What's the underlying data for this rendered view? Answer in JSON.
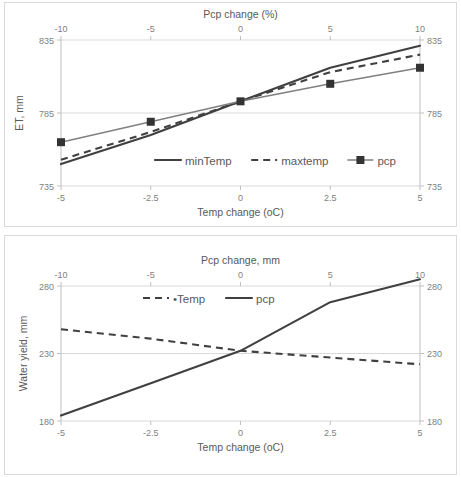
{
  "figure": {
    "charts": [
      {
        "id": "et-chart",
        "title": "",
        "type": "line",
        "x": [
          -5,
          -2.5,
          0,
          2.5,
          5
        ],
        "x2": [
          -10,
          -5,
          0,
          5,
          10
        ],
        "xlabel": "Temp change (oC)",
        "x2label": "Pcp change (%)",
        "ylabel": "ET, mm",
        "ylim": [
          735,
          835
        ],
        "yticks": [
          735,
          785,
          835
        ],
        "xticklabels": [
          "-5",
          "-2.5",
          "0",
          "2.5",
          "5"
        ],
        "x2ticklabels": [
          "-10",
          "-5",
          "0",
          "5",
          "10"
        ],
        "yticklabels": [
          "735",
          "785",
          "835"
        ],
        "y2ticklabels": [
          "735",
          "785",
          "835"
        ],
        "grid": true,
        "legend_position": "inside-bottom-center",
        "series": [
          {
            "name": "minTemp",
            "style": "solid",
            "marker": "none",
            "color": "#404040",
            "values": [
              750,
              770,
              793,
              816,
              831
            ]
          },
          {
            "name": "maxtemp",
            "style": "dashed",
            "marker": "none",
            "color": "#404040",
            "values": [
              753,
              772,
              793,
              813,
              825
            ]
          },
          {
            "name": "pcp",
            "style": "solid-thin",
            "marker": "square",
            "color": "#808080",
            "values": [
              765,
              779,
              793,
              805,
              816
            ]
          }
        ]
      },
      {
        "id": "water-yield-chart",
        "title": "",
        "type": "line",
        "x": [
          -5,
          -2.5,
          0,
          2.5,
          5
        ],
        "x2": [
          -10,
          -5,
          0,
          5,
          10
        ],
        "xlabel": "Temp change (oC)",
        "x2label": "Pcp change, mm",
        "ylabel": "Water yield, mm",
        "ylim": [
          180,
          280
        ],
        "yticks": [
          180,
          230,
          280
        ],
        "xticklabels": [
          "-5",
          "-2.5",
          "0",
          "2.5",
          "5"
        ],
        "x2ticklabels": [
          "-10",
          "-5",
          "0",
          "5",
          "10"
        ],
        "yticklabels": [
          "180",
          "230",
          "280"
        ],
        "y2ticklabels": [
          "180",
          "230",
          "280"
        ],
        "grid": true,
        "legend_position": "inside-top-center",
        "series": [
          {
            "name": "•Temp",
            "style": "dashed",
            "marker": "none",
            "color": "#404040",
            "values": [
              248,
              241,
              232,
              227,
              222
            ]
          },
          {
            "name": "pcp",
            "style": "solid",
            "marker": "none",
            "color": "#404040",
            "values": [
              184,
              208,
              232,
              268,
              285
            ]
          }
        ]
      }
    ]
  },
  "chart_data": [
    {
      "type": "line",
      "title": "ET response to temperature and precipitation change",
      "xlabel": "Temp change (oC)",
      "secondary_xlabel": "Pcp change (%)",
      "ylabel": "ET, mm",
      "x": [
        -5,
        -2.5,
        0,
        2.5,
        5
      ],
      "secondary_x": [
        -10,
        -5,
        0,
        5,
        10
      ],
      "ylim": [
        735,
        835
      ],
      "yticks": [
        735,
        785,
        835
      ],
      "grid": true,
      "legend": [
        "minTemp",
        "maxtemp",
        "pcp"
      ],
      "legend_position": "inside-bottom-center",
      "series": [
        {
          "name": "minTemp",
          "values": [
            750,
            770,
            793,
            816,
            831
          ]
        },
        {
          "name": "maxtemp",
          "values": [
            753,
            772,
            793,
            813,
            825
          ]
        },
        {
          "name": "pcp",
          "values": [
            765,
            779,
            793,
            805,
            816
          ]
        }
      ]
    },
    {
      "type": "line",
      "title": "Water yield response to temperature and precipitation change",
      "xlabel": "Temp change (oC)",
      "secondary_xlabel": "Pcp change, mm",
      "ylabel": "Water yield, mm",
      "x": [
        -5,
        -2.5,
        0,
        2.5,
        5
      ],
      "secondary_x": [
        -10,
        -5,
        0,
        5,
        10
      ],
      "ylim": [
        180,
        280
      ],
      "yticks": [
        180,
        230,
        280
      ],
      "grid": true,
      "legend": [
        "•Temp",
        "pcp"
      ],
      "legend_position": "inside-top-center",
      "series": [
        {
          "name": "•Temp",
          "values": [
            248,
            241,
            232,
            227,
            222
          ]
        },
        {
          "name": "pcp",
          "values": [
            184,
            208,
            232,
            268,
            285
          ]
        }
      ]
    }
  ]
}
